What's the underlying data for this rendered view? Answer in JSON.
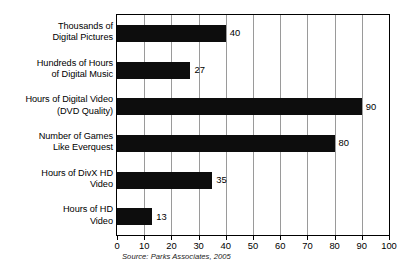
{
  "chart_data": {
    "type": "bar",
    "orientation": "horizontal",
    "title": "",
    "xlabel": "",
    "ylabel": "",
    "xlim": [
      0,
      100
    ],
    "xticks": [
      "0",
      "10",
      "20",
      "30",
      "40",
      "50",
      "60",
      "70",
      "80",
      "90",
      "100"
    ],
    "grid": true,
    "legend": null,
    "categories": [
      "Thousands of Digital Pictures",
      "Hundreds of Hours of Digital Music",
      "Hours of Digital Video (DVD Quality)",
      "Number of Games Like Everquest",
      "Hours of DivX HD Video",
      "Hours of HD Video"
    ],
    "values": [
      40,
      27,
      90,
      80,
      35,
      13
    ],
    "value_labels": [
      "40",
      "27",
      "90",
      "80",
      "35",
      "13"
    ],
    "bar_color": "#0d0d0d",
    "annotations": [
      "Source: Parks Associates, 2005"
    ]
  },
  "category_label_lines": [
    [
      "Thousands of",
      "Digital Pictures"
    ],
    [
      "Hundreds of Hours",
      "of Digital Music"
    ],
    [
      "Hours of Digital Video",
      "(DVD Quality)"
    ],
    [
      "Number of Games",
      "Like Everquest"
    ],
    [
      "Hours of DivX HD",
      "Video"
    ],
    [
      "Hours of HD",
      "Video"
    ]
  ],
  "source_note": "Source: Parks Associates, 2005"
}
